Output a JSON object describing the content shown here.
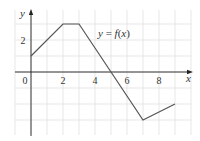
{
  "chart_data": {
    "type": "line",
    "title": "",
    "function_label": "y = f(x)",
    "xlabel": "x",
    "ylabel": "y",
    "x": [
      0,
      2,
      3,
      5,
      7,
      9
    ],
    "series": [
      {
        "name": "f(x)",
        "values": [
          1,
          3,
          3,
          0,
          -3,
          -2
        ]
      }
    ],
    "xlim": [
      -1,
      10
    ],
    "ylim": [
      -4,
      4
    ],
    "xticks": [
      {
        "value": 0,
        "label": "0"
      },
      {
        "value": 2,
        "label": "2"
      },
      {
        "value": 4,
        "label": "4"
      },
      {
        "value": 6,
        "label": "6"
      },
      {
        "value": 8,
        "label": "8"
      }
    ],
    "yticks": [
      {
        "value": 2,
        "label": "2"
      }
    ],
    "grid": true,
    "colors": {
      "line": "#555555",
      "axis": "#222222",
      "grid": "#dddddd"
    }
  }
}
